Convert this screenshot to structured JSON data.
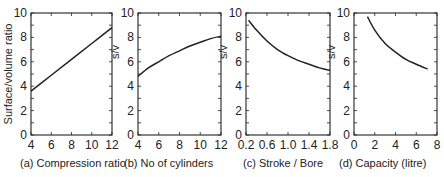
{
  "figure": {
    "background": "#ffffff",
    "line_color": "#222222"
  },
  "chart_data": [
    {
      "type": "line",
      "id": "a",
      "caption": "(a)  Compression ratio",
      "title": "",
      "xlabel": "Compression ratio",
      "ylabel": "Surface/volume ratio",
      "xlim": [
        4,
        12
      ],
      "ylim": [
        0,
        10
      ],
      "xticks": [
        4,
        6,
        8,
        10,
        12
      ],
      "xtick_labels": [
        "4",
        "6",
        "8",
        "10",
        "12"
      ],
      "yticks": [
        0,
        2,
        4,
        6,
        8,
        10
      ],
      "ytick_labels": [
        "0",
        "2",
        "4",
        "6",
        "8",
        "10"
      ],
      "grid": false,
      "x": [
        4,
        6,
        8,
        10,
        12
      ],
      "y": [
        3.6,
        4.9,
        6.2,
        7.5,
        8.8
      ]
    },
    {
      "type": "line",
      "id": "b",
      "caption": "(b)  No of cylinders",
      "title": "",
      "xlabel": "No of cylinders",
      "ylabel": "s/v",
      "xlim": [
        4,
        12
      ],
      "ylim": [
        0,
        10
      ],
      "xticks": [
        4,
        6,
        8,
        10,
        12
      ],
      "xtick_labels": [
        "4",
        "6",
        "8",
        "10",
        "12"
      ],
      "yticks": [
        0,
        2,
        4,
        6,
        8,
        10
      ],
      "ytick_labels": [
        "0",
        "2",
        "4",
        "6",
        "8",
        "10"
      ],
      "grid": false,
      "x": [
        4,
        5,
        6,
        7,
        8,
        9,
        10,
        11,
        12
      ],
      "y": [
        4.8,
        5.5,
        6.0,
        6.5,
        6.9,
        7.3,
        7.6,
        7.9,
        8.1
      ]
    },
    {
      "type": "line",
      "id": "c",
      "caption": "(c)  Stroke / Bore",
      "title": "",
      "xlabel": "Stroke / Bore",
      "ylabel": "s/v",
      "xlim": [
        0.2,
        1.8
      ],
      "ylim": [
        0,
        10
      ],
      "xticks": [
        0.2,
        0.6,
        1.0,
        1.4,
        1.8
      ],
      "xtick_labels": [
        "0.2",
        "0.6",
        "1.0",
        "1.4",
        "1.8"
      ],
      "yticks": [
        0,
        2,
        4,
        6,
        8,
        10
      ],
      "ytick_labels": [
        "0",
        "2",
        "4",
        "6",
        "8",
        "10"
      ],
      "grid": false,
      "x": [
        0.25,
        0.4,
        0.6,
        0.8,
        1.0,
        1.2,
        1.4,
        1.6,
        1.8
      ],
      "y": [
        9.4,
        8.6,
        7.7,
        7.0,
        6.5,
        6.1,
        5.8,
        5.5,
        5.3
      ]
    },
    {
      "type": "line",
      "id": "d",
      "caption": "(d)  Capacity (litre)",
      "title": "",
      "xlabel": "Capacity (litre)",
      "ylabel": "s/v",
      "xlim": [
        0,
        8
      ],
      "ylim": [
        0,
        10
      ],
      "xticks": [
        0,
        2,
        4,
        6,
        8
      ],
      "xtick_labels": [
        "0",
        "2",
        "4",
        "6",
        "8"
      ],
      "yticks": [
        0,
        2,
        4,
        6,
        8,
        10
      ],
      "ytick_labels": [
        "0",
        "2",
        "4",
        "6",
        "8",
        "10"
      ],
      "grid": false,
      "x": [
        1.3,
        2,
        3,
        4,
        5,
        6,
        7.1
      ],
      "y": [
        9.7,
        8.6,
        7.5,
        6.8,
        6.2,
        5.8,
        5.4
      ]
    }
  ]
}
